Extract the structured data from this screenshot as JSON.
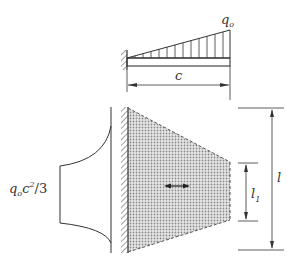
{
  "figure": {
    "beam": {
      "load_label": "q",
      "load_subscript": "o",
      "span_label": "c",
      "load_type": "triangular distributed load",
      "support": "fixed wall"
    },
    "plate": {
      "length_label": "l",
      "edge_label": "l",
      "edge_subscript": "1",
      "fill": "stippled"
    },
    "moment_diagram": {
      "label_q": "q",
      "label_q_sub": "o",
      "label_c": "c",
      "label_exp": "2",
      "label_div": "/3"
    },
    "colors": {
      "line": "#333333",
      "stipple": "#9a9a9a",
      "background": "#ffffff"
    }
  }
}
